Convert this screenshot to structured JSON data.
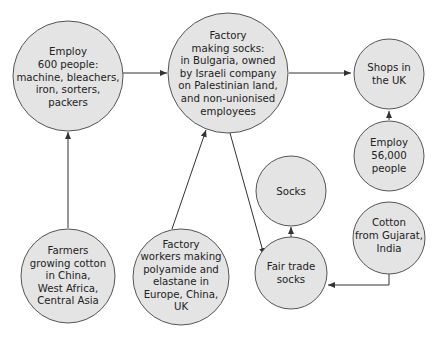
{
  "diagram": {
    "colors": {
      "node_fill": "#e4e4e4",
      "node_stroke": "#555555",
      "edge": "#333333",
      "text": "#222222"
    },
    "nodes": [
      {
        "id": "employ600",
        "lines": [
          "Employ",
          "600 people:",
          "machine, bleachers,",
          "iron, sorters,",
          "packers"
        ]
      },
      {
        "id": "factory_bulgaria",
        "lines": [
          "Factory",
          "making socks:",
          "in Bulgaria, owned",
          "by Israeli company",
          "on Palestinian land,",
          "and non-unionised",
          "employees"
        ]
      },
      {
        "id": "shops_uk",
        "lines": [
          "Shops in",
          "the UK"
        ]
      },
      {
        "id": "employ56000",
        "lines": [
          "Employ",
          "56,000",
          "people"
        ]
      },
      {
        "id": "socks",
        "lines": [
          "Socks"
        ]
      },
      {
        "id": "cotton_gujarat",
        "lines": [
          "Cotton",
          "from Gujarat,",
          "India"
        ]
      },
      {
        "id": "fair_trade_socks",
        "lines": [
          "Fair trade",
          "socks"
        ]
      },
      {
        "id": "farmers",
        "lines": [
          "Farmers",
          "growing cotton",
          "in China,",
          "West Africa,",
          "Central Asia"
        ]
      },
      {
        "id": "factory_workers",
        "lines": [
          "Factory",
          "workers making",
          "polyamide and",
          "elastane in",
          "Europe, China,",
          "UK"
        ]
      }
    ],
    "edges": [
      {
        "from": "employ600",
        "to": "factory_bulgaria"
      },
      {
        "from": "factory_bulgaria",
        "to": "shops_uk"
      },
      {
        "from": "employ56000",
        "to": "shops_uk"
      },
      {
        "from": "farmers",
        "to": "employ600"
      },
      {
        "from": "factory_workers",
        "to": "factory_bulgaria"
      },
      {
        "from": "factory_bulgaria",
        "to": "fair_trade_socks"
      },
      {
        "from": "fair_trade_socks",
        "to": "socks"
      },
      {
        "from": "cotton_gujarat",
        "to": "fair_trade_socks"
      }
    ]
  }
}
